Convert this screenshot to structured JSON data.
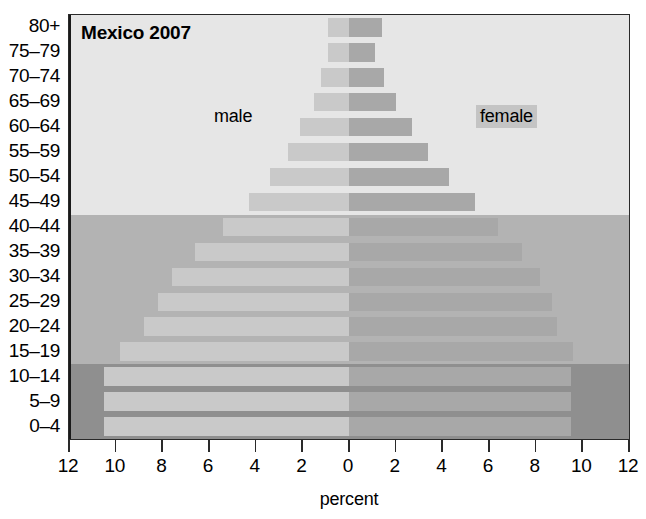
{
  "chart_data": {
    "type": "bar",
    "subtype": "population-pyramid",
    "title": "Mexico 2007",
    "xlabel": "percent",
    "ylabel": "",
    "xlim": [
      -12,
      12
    ],
    "xticks": [
      12,
      10,
      8,
      6,
      4,
      2,
      0,
      2,
      4,
      6,
      8,
      10,
      12
    ],
    "grid": false,
    "legend_position": "in-plot",
    "categories": [
      "0–4",
      "5–9",
      "10–14",
      "15–19",
      "20–24",
      "25–29",
      "30–34",
      "35–39",
      "40–44",
      "45–49",
      "50–54",
      "55–59",
      "60–64",
      "65–69",
      "70–74",
      "75–79",
      "80+"
    ],
    "series": [
      {
        "name": "male",
        "color": "#c9c9c9",
        "direction": "left",
        "values": [
          10.5,
          10.5,
          10.5,
          9.8,
          8.8,
          8.2,
          7.6,
          6.6,
          5.4,
          4.3,
          3.4,
          2.6,
          2.1,
          1.5,
          1.2,
          0.9,
          0.9
        ]
      },
      {
        "name": "female",
        "color": "#a8a8a8",
        "direction": "right",
        "values": [
          9.5,
          9.5,
          9.5,
          9.6,
          8.9,
          8.7,
          8.2,
          7.4,
          6.4,
          5.4,
          4.3,
          3.4,
          2.7,
          2.0,
          1.5,
          1.1,
          1.4
        ]
      }
    ],
    "bands": [
      {
        "name": "dark-band",
        "color": "#8f8f8f",
        "from_category": "0–4",
        "to_category": "10–14"
      },
      {
        "name": "medium-band",
        "color": "#b3b3b3",
        "from_category": "15–19",
        "to_category": "40–44"
      },
      {
        "name": "light-band",
        "color": "#e6e6e6",
        "from_category": "45–49",
        "to_category": "80+"
      }
    ]
  },
  "labels": {
    "male": "male",
    "female": "female"
  }
}
